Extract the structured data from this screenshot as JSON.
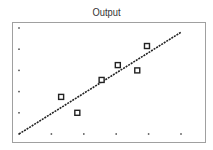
{
  "chart_data": {
    "type": "scatter",
    "title": "Output",
    "xlabel": "",
    "ylabel": "",
    "xlim": [
      0,
      5
    ],
    "ylim": [
      0,
      5
    ],
    "grid": "dots",
    "legend": null,
    "x_ticks": [
      0,
      1,
      2,
      3,
      4,
      5
    ],
    "y_ticks": [
      0,
      1,
      2,
      3,
      4,
      5
    ],
    "series": [
      {
        "name": "observations",
        "type": "scatter",
        "marker": "hollow-square",
        "x": [
          1.3,
          1.8,
          2.55,
          3.05,
          3.65,
          3.95
        ],
        "y": [
          1.75,
          1.0,
          2.55,
          3.25,
          3.0,
          4.15
        ]
      },
      {
        "name": "fit",
        "type": "line",
        "style": "dotted",
        "x": [
          0,
          5
        ],
        "y": [
          0,
          4.8
        ]
      }
    ]
  },
  "colors": {
    "frame": "#a0a0a0",
    "marker": "#222222",
    "line": "#222222",
    "grid_dot": "#444444",
    "title": "#333333"
  }
}
